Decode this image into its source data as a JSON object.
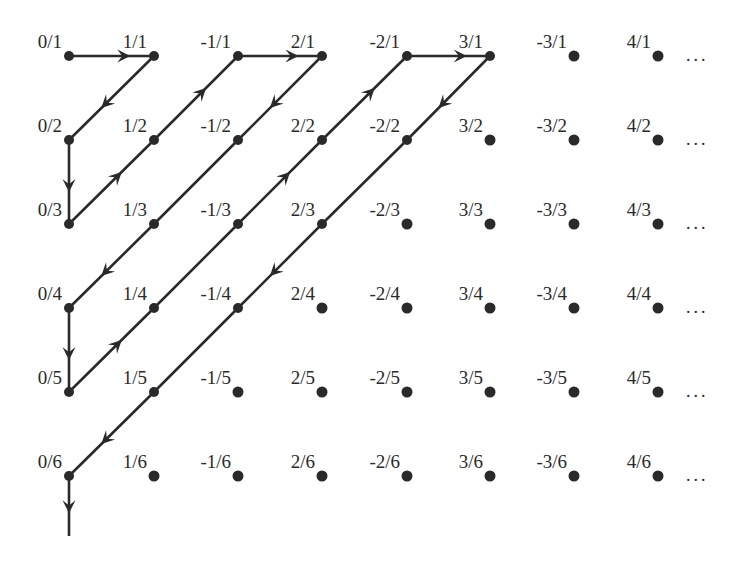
{
  "diagram": {
    "colors": {
      "ink": "#2a2a2a",
      "background": "#ffffff"
    },
    "columns_x": [
      69,
      154,
      238,
      322,
      407,
      490,
      574,
      658
    ],
    "rows_y": [
      56,
      140,
      224,
      308,
      392,
      476
    ],
    "numerators": [
      "0",
      "1",
      "-1",
      "2",
      "-2",
      "3",
      "-3",
      "4"
    ],
    "denominators": [
      "1",
      "2",
      "3",
      "4",
      "5",
      "6"
    ],
    "labels": [
      [
        "0/1",
        "1/1",
        "-1/1",
        "2/1",
        "-2/1",
        "3/1",
        "-3/1",
        "4/1"
      ],
      [
        "0/2",
        "1/2",
        "-1/2",
        "2/2",
        "-2/2",
        "3/2",
        "-3/2",
        "4/2"
      ],
      [
        "0/3",
        "1/3",
        "-1/3",
        "2/3",
        "-2/3",
        "3/3",
        "-3/3",
        "4/3"
      ],
      [
        "0/4",
        "1/4",
        "-1/4",
        "2/4",
        "-2/4",
        "3/4",
        "-3/4",
        "4/4"
      ],
      [
        "0/5",
        "1/5",
        "-1/5",
        "2/5",
        "-2/5",
        "3/5",
        "-3/5",
        "4/5"
      ],
      [
        "0/6",
        "1/6",
        "-1/6",
        "2/6",
        "-2/6",
        "3/6",
        "-3/6",
        "4/6"
      ]
    ],
    "row_ellipsis": "...",
    "path_order": [
      "0/1",
      "1/1",
      "0/2",
      "0/3",
      "1/2",
      "-1/1",
      "2/1",
      "-1/2",
      "1/3",
      "0/4",
      "0/5",
      "1/4",
      "-1/3",
      "2/2",
      "-2/1",
      "3/1",
      "-2/2",
      "2/3",
      "-1/4",
      "1/5",
      "0/6"
    ],
    "path_cells": [
      [
        0,
        0
      ],
      [
        0,
        1
      ],
      [
        1,
        0
      ],
      [
        2,
        0
      ],
      [
        1,
        1
      ],
      [
        0,
        2
      ],
      [
        0,
        3
      ],
      [
        1,
        2
      ],
      [
        2,
        1
      ],
      [
        3,
        0
      ],
      [
        4,
        0
      ],
      [
        3,
        1
      ],
      [
        2,
        2
      ],
      [
        1,
        3
      ],
      [
        0,
        4
      ],
      [
        0,
        5
      ],
      [
        1,
        4
      ],
      [
        2,
        3
      ],
      [
        3,
        2
      ],
      [
        4,
        1
      ],
      [
        5,
        0
      ]
    ],
    "arrow_segments": [
      {
        "from": [
          0,
          0
        ],
        "to": [
          0,
          1
        ]
      },
      {
        "from": [
          0,
          1
        ],
        "to": [
          1,
          0
        ]
      },
      {
        "from": [
          1,
          0
        ],
        "to": [
          2,
          0
        ]
      },
      {
        "from": [
          2,
          0
        ],
        "to": [
          1,
          1
        ]
      },
      {
        "from": [
          1,
          1
        ],
        "to": [
          0,
          2
        ]
      },
      {
        "from": [
          0,
          2
        ],
        "to": [
          0,
          3
        ]
      },
      {
        "from": [
          0,
          3
        ],
        "to": [
          1,
          2
        ]
      },
      {
        "from": [
          2,
          1
        ],
        "to": [
          3,
          0
        ]
      },
      {
        "from": [
          3,
          0
        ],
        "to": [
          4,
          0
        ]
      },
      {
        "from": [
          4,
          0
        ],
        "to": [
          3,
          1
        ]
      },
      {
        "from": [
          2,
          2
        ],
        "to": [
          1,
          3
        ]
      },
      {
        "from": [
          1,
          3
        ],
        "to": [
          0,
          4
        ]
      },
      {
        "from": [
          0,
          4
        ],
        "to": [
          0,
          5
        ]
      },
      {
        "from": [
          0,
          5
        ],
        "to": [
          1,
          4
        ]
      },
      {
        "from": [
          2,
          3
        ],
        "to": [
          3,
          2
        ]
      },
      {
        "from": [
          4,
          1
        ],
        "to": [
          5,
          0
        ]
      }
    ],
    "tail": {
      "from": [
        5,
        0
      ],
      "to_y": 536
    }
  }
}
